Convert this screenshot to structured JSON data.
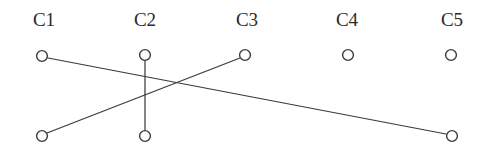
{
  "figure": {
    "title": "",
    "background_color": "#ffffff",
    "stroke_color": "#3a3a3a",
    "label_color": "#2b2b2b",
    "width": 483,
    "height": 154
  },
  "chart_data": {
    "type": "diagram",
    "subtype": "node-link bipartite column diagram",
    "title": "",
    "xlabel": "",
    "ylabel": "",
    "grid": false,
    "legend": null,
    "columns": [
      {
        "id": "C1",
        "label": "C1",
        "label_x": 44,
        "label_y": 26,
        "x": 42
      },
      {
        "id": "C2",
        "label": "C2",
        "label_x": 145,
        "label_y": 26,
        "x": 145
      },
      {
        "id": "C3",
        "label": "C3",
        "label_x": 247,
        "label_y": 26,
        "x": 245
      },
      {
        "id": "C4",
        "label": "C4",
        "label_x": 347,
        "label_y": 26,
        "x": 348
      },
      {
        "id": "C5",
        "label": "C5",
        "label_x": 452,
        "label_y": 26,
        "x": 451
      }
    ],
    "rows": [
      {
        "id": "top",
        "y": 56
      },
      {
        "id": "bottom",
        "y": 136
      }
    ],
    "nodes": [
      {
        "id": "C1-top",
        "column": "C1",
        "row": "top",
        "cx": 42,
        "cy": 56,
        "r": 5.4,
        "filled": false
      },
      {
        "id": "C2-top",
        "column": "C2",
        "row": "top",
        "cx": 145,
        "cy": 55,
        "r": 5.4,
        "filled": false
      },
      {
        "id": "C3-top",
        "column": "C3",
        "row": "top",
        "cx": 245,
        "cy": 55,
        "r": 5.4,
        "filled": false
      },
      {
        "id": "C4-top",
        "column": "C4",
        "row": "top",
        "cx": 348,
        "cy": 55,
        "r": 5.4,
        "filled": false
      },
      {
        "id": "C5-top",
        "column": "C5",
        "row": "top",
        "cx": 451,
        "cy": 55,
        "r": 5.4,
        "filled": false
      },
      {
        "id": "C1-bottom",
        "column": "C1",
        "row": "bottom",
        "cx": 42,
        "cy": 136,
        "r": 5.4,
        "filled": false
      },
      {
        "id": "C2-bottom",
        "column": "C2",
        "row": "bottom",
        "cx": 145,
        "cy": 136,
        "r": 5.4,
        "filled": false
      },
      {
        "id": "C5-bottom",
        "column": "C5",
        "row": "bottom",
        "cx": 452,
        "cy": 136,
        "r": 5.4,
        "filled": false
      }
    ],
    "edges": [
      {
        "id": "edge-c1top-c5bottom",
        "from": "C1-top",
        "to": "C5-bottom",
        "x1": 48,
        "y1": 58,
        "x2": 446,
        "y2": 134
      },
      {
        "id": "edge-c1bottom-c3top",
        "from": "C1-bottom",
        "to": "C3-top",
        "x1": 47,
        "y1": 133,
        "x2": 240,
        "y2": 58
      },
      {
        "id": "edge-c2top-c2bottom",
        "from": "C2-top",
        "to": "C2-bottom",
        "x1": 145,
        "y1": 61,
        "x2": 145,
        "y2": 131
      }
    ],
    "isolated_nodes": [
      "C2-top-partial",
      "C3-top-partial",
      "C4-top",
      "C5-top"
    ]
  }
}
